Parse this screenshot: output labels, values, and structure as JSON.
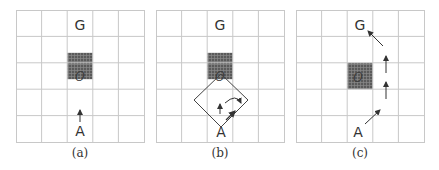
{
  "figure": {
    "grid": {
      "rows": 5,
      "cols": 5,
      "line_color": "#c8c8c8",
      "obstacle_color": "#6e6e6e"
    },
    "labels": {
      "goal": "G",
      "agent": "A",
      "obstacle": "O"
    },
    "panels": [
      {
        "id": "a",
        "caption": "(a)",
        "description": "Agent A below obstacle O, single up arrow toward goal G"
      },
      {
        "id": "b",
        "caption": "(b)",
        "description": "Diamond-shaped sensing region around A touching obstacle; up arrow and curved arrow turning right"
      },
      {
        "id": "c",
        "caption": "(c)",
        "description": "Path from A diagonally right, up two cells, then diagonally left to G, avoiding O"
      }
    ]
  }
}
